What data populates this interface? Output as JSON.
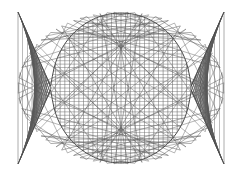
{
  "figure": {
    "background_color": "#ffffff",
    "line_color": "#5a5a5a",
    "line_color_secondary": "#6e6e6e",
    "line_width": 0.55,
    "width": 242,
    "height": 176
  },
  "watermark": {
    "visible": true,
    "color": "#ebebeb",
    "rows": [
      {
        "text": "",
        "top": 16
      },
      {
        "text": "",
        "top": 40
      },
      {
        "text": "",
        "top": 108
      }
    ]
  },
  "chart_data": {
    "type": "line",
    "subtitle": "Two families of straight chords forming a lens with two flaring wings",
    "xlabel": "",
    "ylabel": "",
    "xlim": [
      0,
      242
    ],
    "ylim": [
      0,
      176
    ],
    "grid": false,
    "legend": null,
    "annotations": [
      {
        "label": "left node",
        "x": 51,
        "y": 88
      },
      {
        "label": "right node",
        "x": 190,
        "y": 88
      },
      {
        "label": "lens top",
        "x": 121,
        "y": 13
      },
      {
        "label": "lens bottom",
        "x": 121,
        "y": 163
      },
      {
        "label": "top-left wing tip",
        "x": 18,
        "y": 12
      },
      {
        "label": "bottom-left wing tip",
        "x": 18,
        "y": 164
      },
      {
        "label": "top-right wing tip",
        "x": 224,
        "y": 12
      },
      {
        "label": "bottom-right wing tip",
        "x": 224,
        "y": 164
      }
    ],
    "geometry": {
      "center_x": 121,
      "center_y": 88,
      "node_left_x": 51,
      "node_right_x": 190,
      "lens_half_width": 69.5,
      "lens_half_height": 75,
      "wing_outer_x_left": 18,
      "wing_outer_x_right": 224,
      "wing_half_height": 76,
      "family_a_count": 46,
      "family_b_count": 46,
      "description": "Family A: near-vertical chords swept left-to-right. Family B: near-horizontal chords swept top-to-bottom. Envelopes pinch at two interior nodes."
    },
    "series": [
      {
        "name": "family-a-vertical-chords",
        "count": 46,
        "orientation": "vertical",
        "color": "#5a5a5a"
      },
      {
        "name": "family-b-horizontal-chords",
        "count": 46,
        "orientation": "horizontal",
        "color": "#6e6e6e"
      }
    ]
  }
}
